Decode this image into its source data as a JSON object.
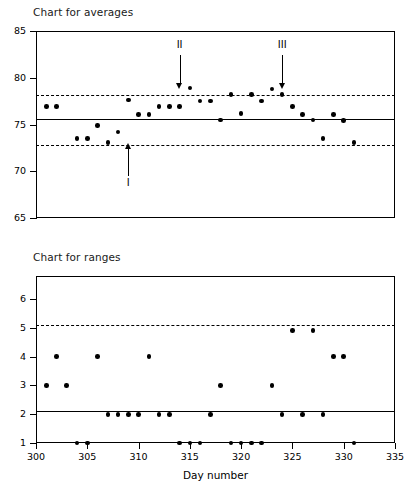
{
  "figure": {
    "averages_title": "Chart for averages",
    "ranges_title": "Chart for ranges",
    "xlabel": "Day number"
  },
  "annotations": [
    {
      "label": "I",
      "day": 309,
      "direction": "up"
    },
    {
      "label": "II",
      "day": 314,
      "direction": "down"
    },
    {
      "label": "III",
      "day": 324,
      "direction": "down"
    }
  ],
  "chart_data": [
    {
      "type": "scatter",
      "title": "Chart for averages",
      "xlabel": "",
      "ylabel": "",
      "xlim": [
        300,
        335
      ],
      "ylim": [
        65,
        85
      ],
      "yticks": [
        65,
        70,
        75,
        80,
        85
      ],
      "xticks": [
        300,
        305,
        310,
        315,
        320,
        325,
        330,
        335
      ],
      "grid": false,
      "legend": "none",
      "center_line": 75.6,
      "upper_control_limit": 78.2,
      "lower_control_limit": 72.8,
      "limit_style": "dashed",
      "x": [
        301,
        302,
        304,
        305,
        306,
        307,
        308,
        309,
        310,
        311,
        312,
        313,
        314,
        315,
        316,
        317,
        318,
        319,
        320,
        321,
        322,
        323,
        324,
        325,
        326,
        327,
        328,
        329,
        330,
        331
      ],
      "y": [
        76.9,
        76.9,
        73.5,
        73.5,
        74.9,
        73.1,
        74.2,
        77.6,
        76.1,
        76.1,
        76.9,
        76.9,
        76.9,
        78.9,
        77.5,
        77.5,
        75.5,
        78.2,
        76.2,
        78.2,
        77.5,
        78.8,
        78.2,
        76.9,
        76.1,
        75.5,
        73.5,
        76.1,
        75.4,
        73.1
      ],
      "annotations": [
        {
          "label": "I",
          "x": 309,
          "direction": "up"
        },
        {
          "label": "II",
          "x": 314,
          "direction": "down"
        },
        {
          "label": "III",
          "x": 324,
          "direction": "down"
        }
      ]
    },
    {
      "type": "scatter",
      "title": "Chart for ranges",
      "xlabel": "Day number",
      "ylabel": "",
      "xlim": [
        300,
        335
      ],
      "ylim": [
        1,
        6.8
      ],
      "yticks": [
        1,
        2,
        3,
        4,
        5,
        6
      ],
      "xticks": [
        300,
        305,
        310,
        315,
        320,
        325,
        330,
        335
      ],
      "grid": false,
      "legend": "none",
      "center_line": 2.1,
      "upper_control_limit": 5.1,
      "limit_style": "dashed",
      "x": [
        301,
        302,
        303,
        304,
        305,
        306,
        307,
        308,
        309,
        310,
        311,
        312,
        313,
        314,
        315,
        316,
        317,
        318,
        319,
        320,
        321,
        322,
        323,
        324,
        325,
        326,
        327,
        328,
        329,
        330,
        331
      ],
      "y": [
        3,
        4,
        3,
        1,
        1,
        4,
        2,
        2,
        2,
        2,
        4,
        2,
        2,
        1,
        1,
        1,
        2,
        3,
        1,
        1,
        1,
        1,
        3,
        2,
        4.9,
        2,
        4.9,
        2,
        4,
        4,
        1
      ]
    }
  ]
}
